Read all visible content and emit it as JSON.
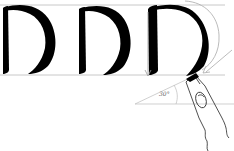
{
  "diagram": {
    "title": "",
    "letters": [
      "D",
      "D",
      "D"
    ],
    "angle_label": "30°",
    "pen_angle_degrees": 30,
    "elements": [
      {
        "name": "top-guide-line",
        "type": "line"
      },
      {
        "name": "baseline",
        "type": "line"
      },
      {
        "name": "letter-d-1",
        "type": "glyph"
      },
      {
        "name": "letter-d-2",
        "type": "glyph"
      },
      {
        "name": "letter-d-3",
        "type": "glyph"
      },
      {
        "name": "downstroke-arrow",
        "type": "arrow"
      },
      {
        "name": "bowl-stroke-arrow",
        "type": "arrow"
      },
      {
        "name": "pen-nib",
        "type": "illustration"
      },
      {
        "name": "angle-indicator",
        "type": "annotation"
      }
    ]
  },
  "colors": {
    "ink": "#000000",
    "guide": "#c8c8c8",
    "arrow": "#999999",
    "pen": "#222222",
    "background": "#ffffff"
  }
}
